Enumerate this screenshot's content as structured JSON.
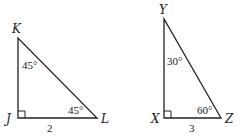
{
  "triangles": [
    {
      "name": "JKL",
      "vertices": {
        "top": "K",
        "right_angle": "J",
        "right": "L"
      },
      "angles": {
        "top": "45°",
        "right": "45°"
      },
      "side_bottom": "2"
    },
    {
      "name": "XYZ",
      "vertices": {
        "top": "Y",
        "right_angle": "X",
        "right": "Z"
      },
      "angles": {
        "top": "30°",
        "right": "60°"
      },
      "side_bottom": "3"
    }
  ],
  "colors": {
    "stroke": "#222222",
    "background": "#ffffff"
  }
}
